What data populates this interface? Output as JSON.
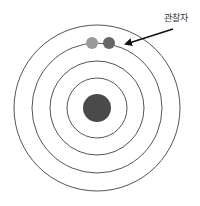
{
  "diagram": {
    "type": "concentric-rings",
    "center": {
      "x": 97,
      "y": 108
    },
    "rings": [
      {
        "r": 83
      },
      {
        "r": 65
      },
      {
        "r": 47
      },
      {
        "r": 30
      }
    ],
    "ring_color": "#555555",
    "core": {
      "r": 14,
      "color": "#4a4a4a"
    },
    "observer_dots": [
      {
        "cx": 92,
        "cy": 43,
        "r": 6,
        "color": "#9a9a9a"
      },
      {
        "cx": 109,
        "cy": 43,
        "r": 6,
        "color": "#666666"
      }
    ],
    "arrow": {
      "x1": 173,
      "y1": 29,
      "x2": 126,
      "y2": 44,
      "color": "#111111"
    },
    "label": {
      "text": "관찰자",
      "x": 164,
      "y": 11
    }
  }
}
